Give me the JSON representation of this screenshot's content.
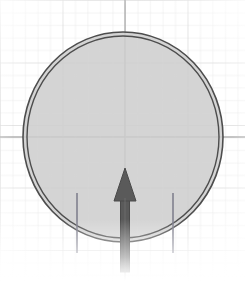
{
  "canvas": {
    "width": 245,
    "height": 281,
    "background_color": "#ffffff",
    "paper_tint": "#f4f4f4"
  },
  "grid": {
    "name": "graph-paper-grid",
    "minor_spacing_px": 12.5,
    "minor_color": "#e3e3e3",
    "major_spacing_px": 62.5,
    "major_color": "#c9c9c9",
    "visible": true,
    "fade_edges": true
  },
  "axes": {
    "horizontal": {
      "label": "horizontal-axis-line",
      "y": 137,
      "x_start": 0,
      "x_end": 245,
      "color": "#b0b0b0",
      "width_px": 1.4
    },
    "vertical": {
      "label": "vertical-axis-line",
      "x": 125,
      "y_start": 0,
      "y_end": 281,
      "color": "#b0b0b0",
      "width_px": 1.4
    }
  },
  "shapes": {
    "circle": {
      "name": "double-outlined-circle",
      "center_x": 123,
      "center_y": 137,
      "radius_x": 100,
      "radius_y": 105,
      "fill_color": "#cdcdcd",
      "fill_opacity": 0.85,
      "outline_color": "#4d4d4d",
      "outline_width_px": 1.6,
      "outline_style": "double",
      "inner_offset_px": 4
    },
    "arrow": {
      "name": "upward-arrow",
      "direction": "up",
      "color": "#5a5a5a",
      "tip_x": 125,
      "tip_y": 168,
      "head_half_width_px": 11,
      "head_height_px": 33,
      "shaft_half_width_px": 4.5,
      "shaft_top_y": 198,
      "shaft_bottom_y": 272,
      "outline_color": "#4a4a4a"
    },
    "tick_left": {
      "name": "left-tick-line",
      "x": 77,
      "y_top": 193,
      "y_bottom": 253,
      "color": "#7b7b8a",
      "width_px": 1.5
    },
    "tick_right": {
      "name": "right-tick-line",
      "x": 173,
      "y_top": 193,
      "y_bottom": 253,
      "color": "#7b7b8a",
      "width_px": 1.5
    }
  },
  "palette": {
    "ink_dark": "#4d4d4d",
    "ink_arrow": "#5a5a5a",
    "fill_gray": "#cdcdcd",
    "grid_minor": "#e3e3e3",
    "grid_major": "#c9c9c9",
    "paper": "#ffffff"
  },
  "labels": {
    "none_visible": ""
  }
}
